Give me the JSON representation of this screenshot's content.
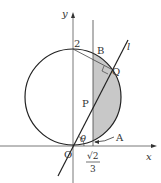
{
  "diagram": {
    "axes": {
      "x_label": "x",
      "y_label": "y",
      "origin_label": "O"
    },
    "labels": {
      "y_intercept": "2",
      "B": "B",
      "Q": "Q",
      "P": "P",
      "A": "A",
      "line": "l",
      "angle": "θ",
      "x_tick_num": "√2",
      "x_tick_den": "3"
    },
    "colors": {
      "stroke": "#222222",
      "shade": "#c8c8c8",
      "axis": "#555555"
    }
  }
}
